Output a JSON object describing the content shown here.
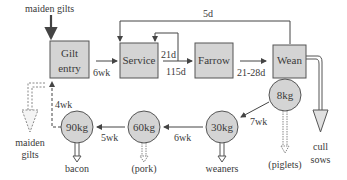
{
  "colors": {
    "box_fill": "#d4d4d4",
    "box_stroke": "#555555",
    "line": "#444444",
    "text": "#3a3a3a",
    "background": "#ffffff"
  },
  "boxes": {
    "gilt_entry": {
      "line1": "Gilt",
      "line2": "entry"
    },
    "service": {
      "label": "Service"
    },
    "farrow": {
      "label": "Farrow"
    },
    "wean": {
      "label": "Wean"
    }
  },
  "circles": {
    "c8": {
      "label": "8kg"
    },
    "c30": {
      "label": "30kg"
    },
    "c60": {
      "label": "60kg"
    },
    "c90": {
      "label": "90kg"
    }
  },
  "labels": {
    "maiden_gilts_top": "maiden gilts",
    "loop_5d": "5d",
    "gilt_to_service": "6wk",
    "service_loop": "21d",
    "service_to_farrow": "115d",
    "farrow_to_wean": "21-28d",
    "wean_to_30": "7wk",
    "c30_to_60": "6wk",
    "c60_to_90": "5wk",
    "c90_to_gilt": "4wk",
    "maiden_gilts_out_1": "maiden",
    "maiden_gilts_out_2": "gilts",
    "bacon": "bacon",
    "pork": "(pork)",
    "weaners": "weaners",
    "piglets": "(piglets)",
    "cull_1": "cull",
    "cull_2": "sows"
  }
}
